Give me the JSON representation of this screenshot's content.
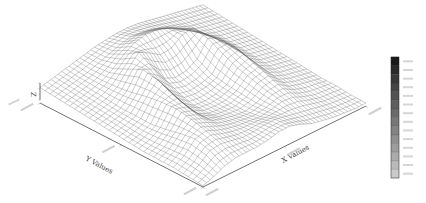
{
  "chart_data": {
    "type": "surface3d",
    "title": "",
    "xlabel": "X Values",
    "ylabel": "Y Values",
    "zlabel": "Z",
    "grid": "wireframe mesh",
    "legend_position": "right colorbar",
    "colorbar": {
      "bands": 14,
      "colors": [
        "#1a1a1a",
        "#2a2a2a",
        "#383838",
        "#454545",
        "#525252",
        "#5e5e5e",
        "#6a6a6a",
        "#777777",
        "#838383",
        "#909090",
        "#9d9d9d",
        "#ababab",
        "#bababa",
        "#cacaca"
      ]
    },
    "x_ticks_count": 3,
    "y_ticks_count": 3,
    "surface_description": "Terrain-like surface with a curved ridge arcing from the back-left across the middle toward the right, a central depression, and a low flat region in the front-right corner",
    "heights": [
      [
        0.3,
        0.34,
        0.38,
        0.42,
        0.46,
        0.5,
        0.52,
        0.54,
        0.54,
        0.52,
        0.48,
        0.44,
        0.4,
        0.36,
        0.32,
        0.28
      ],
      [
        0.28,
        0.32,
        0.36,
        0.4,
        0.46,
        0.52,
        0.58,
        0.62,
        0.6,
        0.56,
        0.5,
        0.44,
        0.38,
        0.34,
        0.3,
        0.26
      ],
      [
        0.26,
        0.3,
        0.34,
        0.4,
        0.5,
        0.64,
        0.74,
        0.78,
        0.76,
        0.7,
        0.6,
        0.48,
        0.38,
        0.32,
        0.28,
        0.24
      ],
      [
        0.24,
        0.28,
        0.32,
        0.42,
        0.62,
        0.8,
        0.7,
        0.58,
        0.6,
        0.72,
        0.74,
        0.56,
        0.4,
        0.3,
        0.26,
        0.22
      ],
      [
        0.22,
        0.26,
        0.3,
        0.46,
        0.74,
        0.66,
        0.42,
        0.34,
        0.36,
        0.46,
        0.7,
        0.62,
        0.4,
        0.28,
        0.24,
        0.2
      ],
      [
        0.2,
        0.24,
        0.3,
        0.52,
        0.7,
        0.46,
        0.3,
        0.26,
        0.28,
        0.34,
        0.58,
        0.62,
        0.38,
        0.26,
        0.22,
        0.18
      ],
      [
        0.18,
        0.22,
        0.3,
        0.56,
        0.6,
        0.36,
        0.24,
        0.22,
        0.24,
        0.3,
        0.48,
        0.54,
        0.34,
        0.24,
        0.2,
        0.16
      ],
      [
        0.16,
        0.22,
        0.34,
        0.58,
        0.52,
        0.32,
        0.24,
        0.22,
        0.22,
        0.28,
        0.42,
        0.46,
        0.3,
        0.22,
        0.18,
        0.14
      ],
      [
        0.16,
        0.24,
        0.4,
        0.54,
        0.46,
        0.34,
        0.28,
        0.24,
        0.22,
        0.26,
        0.36,
        0.38,
        0.26,
        0.2,
        0.16,
        0.12
      ],
      [
        0.16,
        0.26,
        0.44,
        0.48,
        0.4,
        0.34,
        0.3,
        0.28,
        0.26,
        0.28,
        0.32,
        0.3,
        0.22,
        0.16,
        0.14,
        0.12
      ],
      [
        0.14,
        0.24,
        0.38,
        0.4,
        0.36,
        0.32,
        0.32,
        0.34,
        0.34,
        0.3,
        0.26,
        0.22,
        0.18,
        0.14,
        0.12,
        0.1
      ],
      [
        0.12,
        0.18,
        0.26,
        0.3,
        0.3,
        0.3,
        0.32,
        0.36,
        0.36,
        0.3,
        0.22,
        0.18,
        0.14,
        0.12,
        0.1,
        0.1
      ]
    ]
  },
  "plot": {
    "base_corners": {
      "left": [
        40,
        100
      ],
      "front": [
        203,
        187
      ],
      "right": [
        366,
        103
      ],
      "back": [
        203,
        16
      ]
    },
    "z_axis": {
      "x": 40,
      "y_bottom": 100,
      "y_top": 83,
      "scale_px": 62
    },
    "colorbar_box": {
      "x": 391,
      "y": 57,
      "w": 8,
      "h": 121
    },
    "colors": {
      "mesh": "#555555",
      "axis": "#333333",
      "background": "#ffffff"
    }
  }
}
